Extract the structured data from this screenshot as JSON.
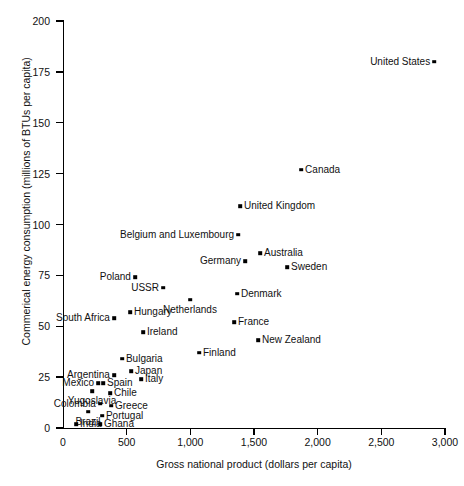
{
  "chart_data": {
    "type": "scatter",
    "title": "",
    "xlabel": "Gross national product (dollars per capita)",
    "ylabel": "Commerical energy consumption (millions of BTUs per capita)",
    "xlim": [
      0,
      3000
    ],
    "ylim": [
      0,
      200
    ],
    "xticks": [
      "0",
      "500",
      "1,000",
      "1,500",
      "2,000",
      "2,500",
      "3,000"
    ],
    "xtick_values": [
      0,
      500,
      1000,
      1500,
      2000,
      2500,
      3000
    ],
    "yticks": [
      "0",
      "25",
      "50",
      "75",
      "100",
      "125",
      "150",
      "175",
      "200"
    ],
    "ytick_values": [
      0,
      25,
      50,
      75,
      100,
      125,
      150,
      175,
      200
    ],
    "grid": false,
    "legend": "none",
    "marker_color": "#000000",
    "points": [
      {
        "label": "United States",
        "x": 2915,
        "y": 180,
        "side": "left"
      },
      {
        "label": "Canada",
        "x": 1870,
        "y": 127,
        "side": "right"
      },
      {
        "label": "United Kingdom",
        "x": 1390,
        "y": 109,
        "side": "right"
      },
      {
        "label": "Belgium and Luxembourg",
        "x": 1375,
        "y": 95,
        "side": "left"
      },
      {
        "label": "Australia",
        "x": 1547,
        "y": 86,
        "side": "right"
      },
      {
        "label": "Germany",
        "x": 1430,
        "y": 82,
        "side": "left"
      },
      {
        "label": "Sweden",
        "x": 1760,
        "y": 79,
        "side": "right"
      },
      {
        "label": "Poland",
        "x": 565,
        "y": 74,
        "side": "left"
      },
      {
        "label": "USSR",
        "x": 785,
        "y": 69,
        "side": "left"
      },
      {
        "label": "Netherlands",
        "x": 997,
        "y": 63,
        "side": "below"
      },
      {
        "label": "Denmark",
        "x": 1366,
        "y": 66,
        "side": "right"
      },
      {
        "label": "Hungary",
        "x": 526,
        "y": 57,
        "side": "right"
      },
      {
        "label": "South Africa",
        "x": 400,
        "y": 54,
        "side": "left"
      },
      {
        "label": "France",
        "x": 1343,
        "y": 52,
        "side": "right"
      },
      {
        "label": "Ireland",
        "x": 628,
        "y": 47,
        "side": "right"
      },
      {
        "label": "New Zealand",
        "x": 1531,
        "y": 43,
        "side": "right"
      },
      {
        "label": "Finland",
        "x": 1068,
        "y": 37,
        "side": "right"
      },
      {
        "label": "Bulgaria",
        "x": 463,
        "y": 34,
        "side": "right"
      },
      {
        "label": "Japan",
        "x": 534,
        "y": 28,
        "side": "right"
      },
      {
        "label": "Argentina",
        "x": 400,
        "y": 26,
        "side": "left"
      },
      {
        "label": "Italy",
        "x": 612,
        "y": 24,
        "side": "right"
      },
      {
        "label": "Mexico",
        "x": 275,
        "y": 22,
        "side": "left"
      },
      {
        "label": "Spain",
        "x": 314,
        "y": 22,
        "side": "right"
      },
      {
        "label": "Yugoslavia",
        "x": 228,
        "y": 18,
        "side": "below"
      },
      {
        "label": "Chile",
        "x": 369,
        "y": 17,
        "side": "right"
      },
      {
        "label": "Colombia",
        "x": 290,
        "y": 12,
        "side": "left"
      },
      {
        "label": "Greece",
        "x": 377,
        "y": 11,
        "side": "right"
      },
      {
        "label": "Brazil",
        "x": 196,
        "y": 8,
        "side": "below"
      },
      {
        "label": "Portugal",
        "x": 306,
        "y": 6,
        "side": "right"
      },
      {
        "label": "India",
        "x": 102,
        "y": 2,
        "side": "right"
      },
      {
        "label": "Ghana",
        "x": 290,
        "y": 2,
        "side": "right"
      }
    ]
  }
}
